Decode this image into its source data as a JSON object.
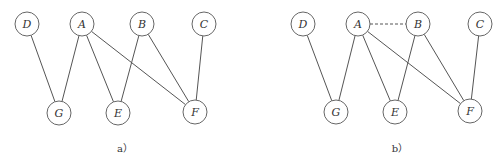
{
  "panels": [
    {
      "caption": "a）",
      "caption_pos": [
        125,
        152
      ],
      "nodes": [
        {
          "id": "D",
          "label": "D",
          "x": 27,
          "y": 24
        },
        {
          "id": "A",
          "label": "A",
          "x": 82,
          "y": 24
        },
        {
          "id": "B",
          "label": "B",
          "x": 142,
          "y": 24
        },
        {
          "id": "C",
          "label": "C",
          "x": 204,
          "y": 24
        },
        {
          "id": "G",
          "label": "G",
          "x": 59,
          "y": 113
        },
        {
          "id": "E",
          "label": "E",
          "x": 118,
          "y": 113
        },
        {
          "id": "F",
          "label": "F",
          "x": 195,
          "y": 112
        }
      ],
      "edges": [
        {
          "from": "D",
          "to": "G",
          "style": "solid"
        },
        {
          "from": "A",
          "to": "G",
          "style": "solid"
        },
        {
          "from": "A",
          "to": "E",
          "style": "solid"
        },
        {
          "from": "A",
          "to": "F",
          "style": "solid"
        },
        {
          "from": "B",
          "to": "E",
          "style": "solid"
        },
        {
          "from": "B",
          "to": "F",
          "style": "solid"
        },
        {
          "from": "C",
          "to": "F",
          "style": "solid"
        }
      ]
    },
    {
      "caption": "b）",
      "caption_pos": [
        400,
        152
      ],
      "nodes": [
        {
          "id": "D",
          "label": "D",
          "x": 303,
          "y": 24
        },
        {
          "id": "A",
          "label": "A",
          "x": 358,
          "y": 24
        },
        {
          "id": "B",
          "label": "B",
          "x": 418,
          "y": 24
        },
        {
          "id": "C",
          "label": "C",
          "x": 480,
          "y": 24
        },
        {
          "id": "G",
          "label": "G",
          "x": 336,
          "y": 112
        },
        {
          "id": "E",
          "label": "E",
          "x": 395,
          "y": 112
        },
        {
          "id": "F",
          "label": "F",
          "x": 470,
          "y": 111
        }
      ],
      "edges": [
        {
          "from": "A",
          "to": "B",
          "style": "dashed"
        },
        {
          "from": "D",
          "to": "G",
          "style": "solid"
        },
        {
          "from": "A",
          "to": "G",
          "style": "solid"
        },
        {
          "from": "A",
          "to": "E",
          "style": "solid"
        },
        {
          "from": "A",
          "to": "F",
          "style": "solid"
        },
        {
          "from": "B",
          "to": "E",
          "style": "solid"
        },
        {
          "from": "B",
          "to": "F",
          "style": "solid"
        },
        {
          "from": "C",
          "to": "F",
          "style": "solid"
        }
      ]
    }
  ],
  "node_radius": 12
}
